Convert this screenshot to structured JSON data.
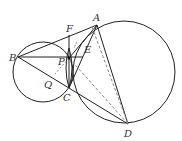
{
  "diagram": {
    "type": "geometry",
    "points": {
      "A": {
        "label": "A",
        "x": 97,
        "y": 25
      },
      "B": {
        "label": "B",
        "x": 18,
        "y": 57
      },
      "C": {
        "label": "C",
        "x": 69,
        "y": 88
      },
      "D": {
        "label": "D",
        "x": 128,
        "y": 124
      },
      "E": {
        "label": "E",
        "x": 83,
        "y": 57
      },
      "F": {
        "label": "F",
        "x": 69,
        "y": 35
      },
      "P": {
        "label": "P",
        "x": 69,
        "y": 58
      },
      "Q": {
        "label": "Q",
        "x": 51,
        "y": 80
      }
    },
    "circles": [
      {
        "name": "small-circle",
        "cx": 43,
        "cy": 72,
        "r": 30
      },
      {
        "name": "large-circle",
        "cx": 124,
        "cy": 72,
        "r": 51
      }
    ],
    "stroke_color": "#222222",
    "dashed_color": "#888888"
  }
}
